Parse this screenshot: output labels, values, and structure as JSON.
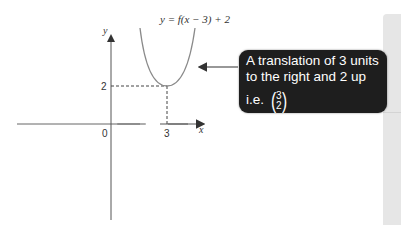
{
  "diagram": {
    "function_label": "y = f(x − 3) + 2",
    "axes": {
      "x_label": "x",
      "y_label": "y",
      "origin_label": "0",
      "x_tick_label": "3",
      "y_tick_label": "2"
    },
    "vertex": {
      "x": 3,
      "y": 2
    },
    "callout": {
      "line1": "A translation of 3 units",
      "line2": "to the right and 2 up",
      "line3_prefix": "i.e.",
      "vector_top": "3",
      "vector_bottom": "2",
      "paren_open": "(",
      "paren_close": ")"
    },
    "colors": {
      "callout_bg": "#1e1e1e",
      "callout_text": "#ffffff",
      "curve": "#8a8a8a",
      "axis": "#555555",
      "panel": "#e6e6e6"
    }
  }
}
